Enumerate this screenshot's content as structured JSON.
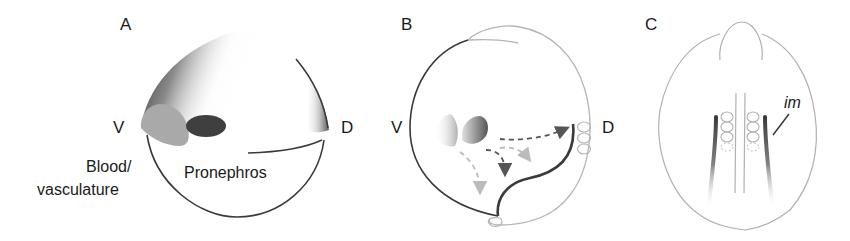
{
  "figure": {
    "panels": [
      {
        "id": "A",
        "letter": "A",
        "axis_left": "V",
        "axis_right": "D",
        "labels": {
          "blood_line1": "Blood/",
          "blood_line2": "vasculature",
          "pronephros": "Pronephros"
        }
      },
      {
        "id": "B",
        "letter": "B",
        "axis_left": "V",
        "axis_right": "D"
      },
      {
        "id": "C",
        "letter": "C",
        "labels": {
          "im": "im"
        }
      }
    ],
    "colors": {
      "outline_dark": "#3a3a3a",
      "outline_light": "#b5b5b5",
      "shade_dark": "#4a4a4a",
      "shade_mid": "#9a9a9a",
      "shade_light": "#c8c8c8",
      "arrow_dark": "#555555",
      "arrow_light": "#b8b8b8"
    }
  }
}
